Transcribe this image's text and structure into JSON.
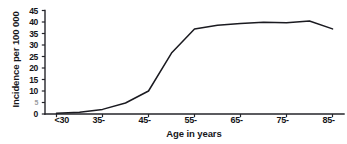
{
  "chart_data": {
    "type": "line",
    "title": "",
    "xlabel": "Age in years",
    "ylabel": "Incidence per 100 000",
    "categories": [
      "<30",
      "35-",
      "45-",
      "55-",
      "65-",
      "75-",
      "85-"
    ],
    "x_tick_labels": [
      "<30",
      "35-",
      "45-",
      "55-",
      "65-",
      "75-",
      "85-"
    ],
    "y_tick_labels": [
      "0",
      "5",
      "10",
      "15",
      "20",
      "25",
      "30",
      "35",
      "40",
      "45"
    ],
    "y_tick_values": [
      0,
      5,
      10,
      15,
      20,
      25,
      30,
      35,
      40,
      45
    ],
    "ylim": [
      0,
      45
    ],
    "xlim": [
      25,
      90
    ],
    "grid": false,
    "legend": false,
    "legend_position": "none",
    "series": [
      {
        "name": "Incidence",
        "x": [
          27.5,
          32.5,
          37.5,
          42.5,
          47.5,
          52.5,
          57.5,
          62.5,
          67.5,
          72.5,
          77.5,
          82.5,
          87.5
        ],
        "values": [
          0.3,
          0.8,
          2.0,
          4.8,
          10.0,
          26.5,
          37.0,
          38.6,
          39.3,
          39.9,
          39.7,
          40.4,
          37.0
        ]
      }
    ],
    "annotations": [],
    "line_color": "#1a1a20",
    "axis_color": "#24242a",
    "background_color": "#ffffff"
  },
  "axes": {
    "y_ticks": [
      {
        "label": "45",
        "value": 45
      },
      {
        "label": "40",
        "value": 40
      },
      {
        "label": "35",
        "value": 35
      },
      {
        "label": "30",
        "value": 30
      },
      {
        "label": "25",
        "value": 25
      },
      {
        "label": "20",
        "value": 20
      },
      {
        "label": "15",
        "value": 15
      },
      {
        "label": "10",
        "value": 10
      },
      {
        "label": "5",
        "value": 5
      },
      {
        "label": "0",
        "value": 0
      }
    ],
    "x_ticks": [
      {
        "label": "<30",
        "value": 27.5
      },
      {
        "label": "35-",
        "value": 37.5
      },
      {
        "label": "45-",
        "value": 47.5
      },
      {
        "label": "55-",
        "value": 57.5
      },
      {
        "label": "65-",
        "value": 67.5
      },
      {
        "label": "75-",
        "value": 77.5
      },
      {
        "label": "85-",
        "value": 87.5
      }
    ]
  }
}
